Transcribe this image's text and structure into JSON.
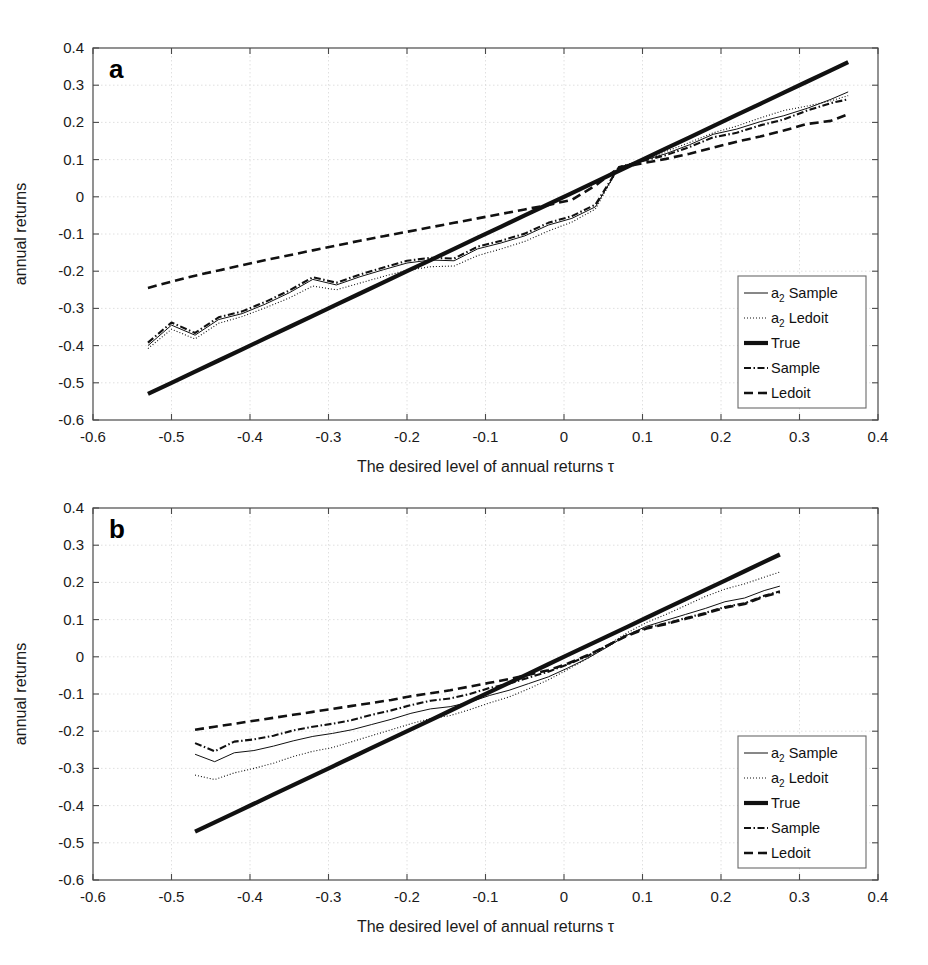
{
  "figure": {
    "width": 928,
    "height": 965,
    "background": "#ffffff",
    "ink_color": "#111111",
    "grid_color": "#d8d8d8"
  },
  "panels": [
    {
      "id": "a",
      "letter": "a"
    },
    {
      "id": "b",
      "letter": "b"
    }
  ],
  "legend": {
    "entries": [
      {
        "label_main": "a",
        "label_sub": "2",
        "label_rest": " Sample",
        "style": "solid-thin",
        "key": "a2-sample"
      },
      {
        "label_main": "a",
        "label_sub": "2",
        "label_rest": " Ledoit",
        "style": "dotted",
        "key": "a2-ledoit"
      },
      {
        "label_main": "True",
        "label_sub": "",
        "label_rest": "",
        "style": "solid-thick",
        "key": "true"
      },
      {
        "label_main": "Sample",
        "label_sub": "",
        "label_rest": "",
        "style": "dash-dot",
        "key": "sample"
      },
      {
        "label_main": "Ledoit",
        "label_sub": "",
        "label_rest": "",
        "style": "dashed",
        "key": "ledoit"
      }
    ]
  },
  "chart_data": [
    {
      "type": "line",
      "panel": "a",
      "title": "",
      "xlabel": "The desired level of annual returns τ",
      "ylabel": "annual returns",
      "xlim": [
        -0.6,
        0.4
      ],
      "ylim": [
        -0.6,
        0.4
      ],
      "xticks": [
        -0.6,
        -0.5,
        -0.4,
        -0.3,
        -0.2,
        -0.1,
        0,
        0.1,
        0.2,
        0.3,
        0.4
      ],
      "xticklabels": [
        "-0.6",
        "-0.5",
        "-0.4",
        "-0.3",
        "-0.2",
        "-0.1",
        "0",
        "0.1",
        "0.2",
        "0.3",
        "0.4"
      ],
      "yticks": [
        -0.6,
        -0.5,
        -0.4,
        -0.3,
        -0.2,
        -0.1,
        0,
        0.1,
        0.2,
        0.3,
        0.4
      ],
      "yticklabels": [
        "-0.6",
        "-0.5",
        "-0.4",
        "-0.3",
        "-0.2",
        "-0.1",
        "0",
        "0.1",
        "0.2",
        "0.3",
        "0.4"
      ],
      "grid": true,
      "legend_position": "lower-right",
      "x": [
        -0.53,
        -0.5,
        -0.47,
        -0.44,
        -0.41,
        -0.38,
        -0.35,
        -0.32,
        -0.29,
        -0.26,
        -0.23,
        -0.2,
        -0.17,
        -0.14,
        -0.11,
        -0.08,
        -0.05,
        -0.02,
        0.01,
        0.04,
        0.07,
        0.1,
        0.13,
        0.16,
        0.19,
        0.22,
        0.25,
        0.28,
        0.31,
        0.34,
        0.362
      ],
      "series": [
        {
          "name": "a2 Sample",
          "style": "solid-thin",
          "values": [
            -0.4,
            -0.345,
            -0.372,
            -0.33,
            -0.314,
            -0.288,
            -0.258,
            -0.222,
            -0.237,
            -0.215,
            -0.196,
            -0.178,
            -0.17,
            -0.172,
            -0.14,
            -0.124,
            -0.105,
            -0.076,
            -0.058,
            -0.027,
            0.08,
            0.097,
            0.116,
            0.14,
            0.168,
            0.182,
            0.202,
            0.218,
            0.238,
            0.262,
            0.282
          ]
        },
        {
          "name": "a2 Ledoit",
          "style": "dotted",
          "values": [
            -0.408,
            -0.356,
            -0.382,
            -0.34,
            -0.322,
            -0.298,
            -0.272,
            -0.24,
            -0.25,
            -0.232,
            -0.214,
            -0.198,
            -0.188,
            -0.186,
            -0.158,
            -0.14,
            -0.12,
            -0.092,
            -0.068,
            -0.033,
            0.08,
            0.098,
            0.122,
            0.146,
            0.172,
            0.19,
            0.212,
            0.232,
            0.244,
            0.258,
            0.272
          ]
        },
        {
          "name": "True",
          "style": "solid-thick",
          "values": [
            -0.53,
            -0.5,
            -0.47,
            -0.44,
            -0.41,
            -0.38,
            -0.35,
            -0.32,
            -0.29,
            -0.26,
            -0.23,
            -0.2,
            -0.17,
            -0.14,
            -0.11,
            -0.08,
            -0.05,
            -0.02,
            0.01,
            0.04,
            0.07,
            0.1,
            0.13,
            0.16,
            0.19,
            0.22,
            0.25,
            0.28,
            0.31,
            0.34,
            0.362
          ]
        },
        {
          "name": "Sample",
          "style": "dash-dot",
          "values": [
            -0.392,
            -0.338,
            -0.366,
            -0.324,
            -0.308,
            -0.282,
            -0.252,
            -0.216,
            -0.231,
            -0.209,
            -0.19,
            -0.172,
            -0.164,
            -0.166,
            -0.134,
            -0.118,
            -0.099,
            -0.07,
            -0.052,
            -0.021,
            0.08,
            0.096,
            0.112,
            0.134,
            0.16,
            0.172,
            0.192,
            0.208,
            0.232,
            0.252,
            0.262
          ]
        },
        {
          "name": "Ledoit",
          "style": "dashed",
          "values": [
            -0.245,
            -0.228,
            -0.212,
            -0.198,
            -0.184,
            -0.17,
            -0.157,
            -0.144,
            -0.131,
            -0.118,
            -0.106,
            -0.094,
            -0.082,
            -0.07,
            -0.058,
            -0.046,
            -0.034,
            -0.022,
            -0.008,
            0.03,
            0.078,
            0.09,
            0.102,
            0.116,
            0.132,
            0.148,
            0.162,
            0.178,
            0.196,
            0.204,
            0.222
          ]
        }
      ]
    },
    {
      "type": "line",
      "panel": "b",
      "title": "",
      "xlabel": "The desired level of annual returns τ",
      "ylabel": "annual returns",
      "xlim": [
        -0.6,
        0.4
      ],
      "ylim": [
        -0.6,
        0.4
      ],
      "xticks": [
        -0.6,
        -0.5,
        -0.4,
        -0.3,
        -0.2,
        -0.1,
        0,
        0.1,
        0.2,
        0.3,
        0.4
      ],
      "xticklabels": [
        "-0.6",
        "-0.5",
        "-0.4",
        "-0.3",
        "-0.2",
        "-0.1",
        "0",
        "0.1",
        "0.2",
        "0.3",
        "0.4"
      ],
      "yticks": [
        -0.6,
        -0.5,
        -0.4,
        -0.3,
        -0.2,
        -0.1,
        0,
        0.1,
        0.2,
        0.3,
        0.4
      ],
      "yticklabels": [
        "-0.6",
        "-0.5",
        "-0.4",
        "-0.3",
        "-0.2",
        "-0.1",
        "0",
        "0.1",
        "0.2",
        "0.3",
        "0.4"
      ],
      "grid": true,
      "legend_position": "lower-right",
      "x": [
        -0.47,
        -0.445,
        -0.42,
        -0.395,
        -0.37,
        -0.345,
        -0.32,
        -0.295,
        -0.27,
        -0.245,
        -0.22,
        -0.195,
        -0.17,
        -0.145,
        -0.12,
        -0.095,
        -0.07,
        -0.045,
        -0.02,
        0.005,
        0.03,
        0.055,
        0.08,
        0.105,
        0.13,
        0.155,
        0.18,
        0.205,
        0.23,
        0.255,
        0.275
      ],
      "series": [
        {
          "name": "a2 Sample",
          "style": "solid-thin",
          "values": [
            -0.262,
            -0.282,
            -0.258,
            -0.252,
            -0.24,
            -0.226,
            -0.214,
            -0.206,
            -0.196,
            -0.182,
            -0.168,
            -0.152,
            -0.14,
            -0.134,
            -0.122,
            -0.104,
            -0.09,
            -0.072,
            -0.054,
            -0.03,
            -0.004,
            0.026,
            0.058,
            0.082,
            0.098,
            0.114,
            0.13,
            0.148,
            0.158,
            0.178,
            0.19
          ]
        },
        {
          "name": "a2 Ledoit",
          "style": "dotted",
          "values": [
            -0.318,
            -0.33,
            -0.312,
            -0.3,
            -0.286,
            -0.268,
            -0.254,
            -0.244,
            -0.228,
            -0.212,
            -0.196,
            -0.18,
            -0.166,
            -0.158,
            -0.142,
            -0.124,
            -0.108,
            -0.086,
            -0.062,
            -0.034,
            -0.004,
            0.03,
            0.064,
            0.092,
            0.114,
            0.138,
            0.162,
            0.182,
            0.196,
            0.214,
            0.228
          ]
        },
        {
          "name": "True",
          "style": "solid-thick",
          "values": [
            -0.47,
            -0.445,
            -0.42,
            -0.395,
            -0.37,
            -0.345,
            -0.32,
            -0.295,
            -0.27,
            -0.245,
            -0.22,
            -0.195,
            -0.17,
            -0.145,
            -0.12,
            -0.095,
            -0.07,
            -0.045,
            -0.02,
            0.005,
            0.03,
            0.055,
            0.08,
            0.105,
            0.13,
            0.155,
            0.18,
            0.205,
            0.23,
            0.255,
            0.275
          ]
        },
        {
          "name": "Sample",
          "style": "dash-dot",
          "values": [
            -0.232,
            -0.254,
            -0.228,
            -0.222,
            -0.212,
            -0.198,
            -0.188,
            -0.18,
            -0.17,
            -0.156,
            -0.144,
            -0.13,
            -0.118,
            -0.112,
            -0.1,
            -0.084,
            -0.072,
            -0.056,
            -0.04,
            -0.02,
            0.002,
            0.03,
            0.058,
            0.078,
            0.09,
            0.104,
            0.118,
            0.134,
            0.144,
            0.164,
            0.176
          ]
        },
        {
          "name": "Ledoit",
          "style": "dashed",
          "values": [
            -0.196,
            -0.188,
            -0.18,
            -0.172,
            -0.164,
            -0.156,
            -0.148,
            -0.14,
            -0.132,
            -0.124,
            -0.116,
            -0.106,
            -0.098,
            -0.09,
            -0.08,
            -0.07,
            -0.06,
            -0.048,
            -0.036,
            -0.018,
            0.004,
            0.03,
            0.056,
            0.076,
            0.088,
            0.102,
            0.116,
            0.132,
            0.142,
            0.162,
            0.174
          ]
        }
      ]
    }
  ]
}
